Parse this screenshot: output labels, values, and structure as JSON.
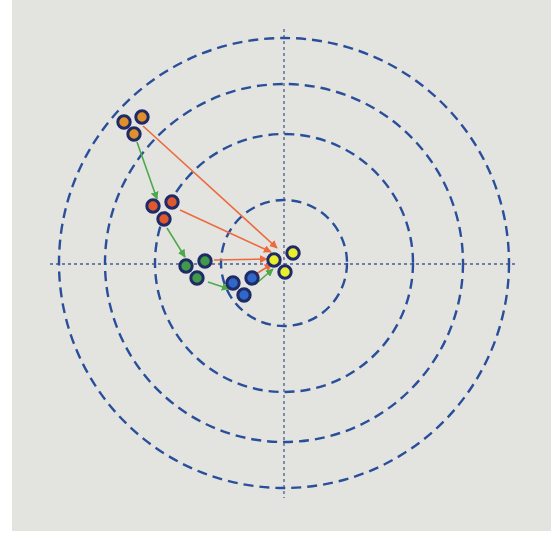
{
  "diagram": {
    "type": "target-trajectory",
    "panel": {
      "background": "#e3e3e0",
      "x": 12,
      "y": 0,
      "width": 539,
      "height": 531
    },
    "center": {
      "x": 284,
      "y": 263
    },
    "axis_color": "#4a5f8e",
    "ring_color": "#2a4f9a",
    "rings": [
      {
        "name": "ring-1",
        "r": 63
      },
      {
        "name": "ring-2",
        "r": 129
      },
      {
        "name": "ring-3",
        "r": 179
      },
      {
        "name": "ring-4",
        "r": 225
      }
    ],
    "axes": {
      "horizontal": {
        "x1": 50,
        "x2": 518,
        "y": 264
      },
      "vertical": {
        "x": 284,
        "y1": 29,
        "y2": 498
      }
    },
    "point_ring_color": "#1f2a66",
    "clusters": [
      {
        "name": "cluster-orange",
        "fill": "#e0902a",
        "points": [
          [
            124,
            122
          ],
          [
            142,
            117
          ],
          [
            134,
            134
          ]
        ]
      },
      {
        "name": "cluster-red",
        "fill": "#e0582e",
        "points": [
          [
            153,
            206
          ],
          [
            172,
            202
          ],
          [
            164,
            219
          ]
        ]
      },
      {
        "name": "cluster-green",
        "fill": "#3f9a4a",
        "points": [
          [
            186,
            266
          ],
          [
            205,
            261
          ],
          [
            197,
            278
          ]
        ]
      },
      {
        "name": "cluster-blue",
        "fill": "#2f68c8",
        "points": [
          [
            233,
            283
          ],
          [
            252,
            278
          ],
          [
            244,
            295
          ]
        ]
      },
      {
        "name": "cluster-yellow",
        "fill": "#e6ee2e",
        "points": [
          [
            274,
            260
          ],
          [
            293,
            253
          ],
          [
            285,
            272
          ]
        ]
      }
    ],
    "arrows": [
      {
        "name": "green-arrow-orange-to-red",
        "color": "#4caa4a",
        "from": [
          137,
          142
        ],
        "to": [
          157,
          199
        ]
      },
      {
        "name": "green-arrow-red-to-green",
        "color": "#4caa4a",
        "from": [
          167,
          228
        ],
        "to": [
          185,
          257
        ]
      },
      {
        "name": "green-arrow-green-to-blue",
        "color": "#4caa4a",
        "from": [
          208,
          282
        ],
        "to": [
          229,
          289
        ]
      },
      {
        "name": "green-arrow-blue-to-yellow",
        "color": "#4caa4a",
        "from": [
          258,
          282
        ],
        "to": [
          273,
          269
        ]
      },
      {
        "name": "red-arrow-orange-to-yellow",
        "color": "#ec6a3e",
        "from": [
          143,
          126
        ],
        "to": [
          277,
          248
        ]
      },
      {
        "name": "red-arrow-red-to-yellow",
        "color": "#ec6a3e",
        "from": [
          180,
          210
        ],
        "to": [
          271,
          252
        ]
      },
      {
        "name": "red-arrow-green-to-yellow",
        "color": "#ec6a3e",
        "from": [
          214,
          260
        ],
        "to": [
          267,
          259
        ]
      },
      {
        "name": "red-arrow-blue-to-yellow",
        "color": "#ec6a3e",
        "from": [
          256,
          274
        ],
        "to": [
          272,
          264
        ]
      }
    ]
  }
}
